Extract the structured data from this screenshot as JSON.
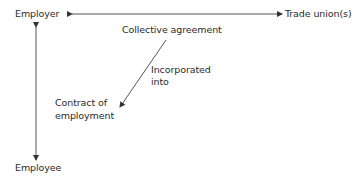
{
  "diagram": {
    "nodes": {
      "employer": "Employer",
      "trade_unions": "Trade union(s)",
      "employee": "Employee",
      "collective_agreement": "Collective agreement",
      "contract_line1": "Contract of",
      "contract_line2": "employment"
    },
    "edge_labels": {
      "incorporated_line1": "Incorporated",
      "incorporated_line2": "into"
    },
    "edges": [
      {
        "from": "Employer",
        "to": "Trade union(s)",
        "type": "bidirectional"
      },
      {
        "from": "Employer",
        "to": "Employee",
        "type": "bidirectional"
      },
      {
        "from": "Collective agreement",
        "to": "Contract of employment",
        "type": "directed",
        "label": "Incorporated into"
      }
    ],
    "colors": {
      "line": "#555555",
      "text": "#2b2b2b"
    }
  }
}
